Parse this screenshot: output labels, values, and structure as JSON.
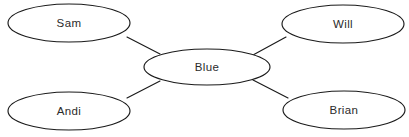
{
  "diagram": {
    "type": "concept-map",
    "title": "",
    "background_color": "#ffffff",
    "stroke_color": "#1a1a1a",
    "text_color": "#2b2b2b",
    "nodes": [
      {
        "id": "sam",
        "label": "Sam",
        "role": "outer",
        "cx": 69,
        "cy": 23,
        "rx": 61,
        "ry": 19
      },
      {
        "id": "will",
        "label": "Will",
        "role": "outer",
        "cx": 343,
        "cy": 24,
        "rx": 61,
        "ry": 19
      },
      {
        "id": "blue",
        "label": "Blue",
        "role": "center",
        "cx": 207,
        "cy": 67,
        "rx": 63,
        "ry": 18
      },
      {
        "id": "andi",
        "label": "Andi",
        "role": "outer",
        "cx": 69,
        "cy": 111,
        "rx": 61,
        "ry": 19
      },
      {
        "id": "brian",
        "label": "Brian",
        "role": "outer",
        "cx": 344,
        "cy": 110,
        "rx": 61,
        "ry": 19
      }
    ],
    "edges": [
      {
        "id": "blue-sam",
        "from": "blue",
        "to": "sam",
        "x1": 160,
        "y1": 54,
        "x2": 127,
        "y2": 37
      },
      {
        "id": "blue-will",
        "from": "blue",
        "to": "will",
        "x1": 253,
        "y1": 55,
        "x2": 286,
        "y2": 37
      },
      {
        "id": "blue-andi",
        "from": "blue",
        "to": "andi",
        "x1": 160,
        "y1": 81,
        "x2": 127,
        "y2": 98
      },
      {
        "id": "blue-brian",
        "from": "blue",
        "to": "brian",
        "x1": 253,
        "y1": 80,
        "x2": 288,
        "y2": 98
      }
    ]
  }
}
